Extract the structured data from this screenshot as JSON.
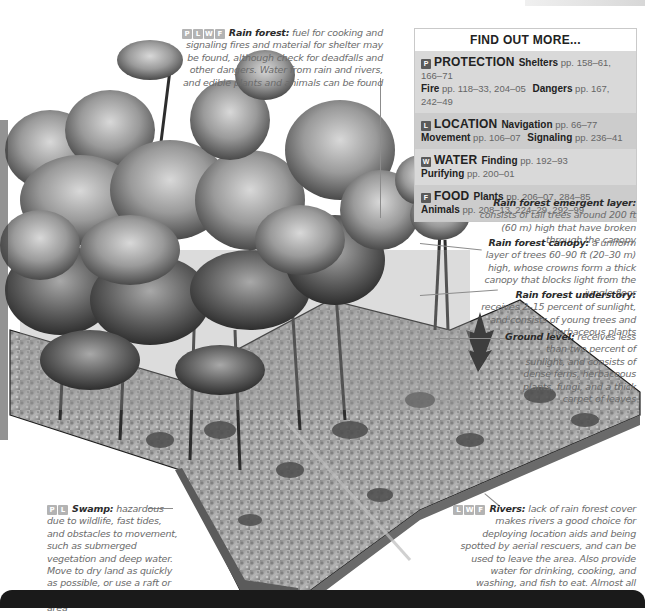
{
  "page": {
    "header_partial": "ROPICAL ENVIRONMENTS"
  },
  "find_out_more": {
    "title": "FIND OUT MORE...",
    "sections": [
      {
        "badge": "P",
        "category": "PROTECTION",
        "lines": [
          [
            {
              "topic": "Shelters",
              "pages": "pp. 158–61, 166–71"
            }
          ],
          [
            {
              "topic": "Fire",
              "pages": "pp. 118–33, 204–05"
            },
            {
              "topic": "Dangers",
              "pages": "pp. 167, 242–49"
            }
          ]
        ]
      },
      {
        "badge": "L",
        "category": "LOCATION",
        "lines": [
          [
            {
              "topic": "Navigation",
              "pages": "pp. 66–77"
            }
          ],
          [
            {
              "topic": "Movement",
              "pages": "pp. 106–07"
            },
            {
              "topic": "Signaling",
              "pages": "pp. 236–41"
            }
          ]
        ]
      },
      {
        "badge": "W",
        "category": "WATER",
        "lines": [
          [
            {
              "topic": "Finding",
              "pages": "pp. 192–93"
            }
          ],
          [
            {
              "topic": "Purifying",
              "pages": "pp. 200–01"
            }
          ]
        ]
      },
      {
        "badge": "F",
        "category": "FOOD",
        "lines": [
          [
            {
              "topic": "Plants",
              "pages": "pp. 206–07, 284–85"
            }
          ],
          [
            {
              "topic": "Animals",
              "pages": "pp. 208–13, 224–29, 292–99"
            }
          ]
        ]
      }
    ]
  },
  "annotations": {
    "rain_forest": {
      "badges": [
        "P",
        "L",
        "W",
        "F"
      ],
      "title": "Rain forest:",
      "text": " fuel for cooking and signaling fires and material for shelter may be found, although check for deadfalls and other dangers. Water from rain and rivers, and edible plants and animals can be found"
    },
    "emergent": {
      "title": "Rain forest emergent layer:",
      "text": " consists of tall trees around 200 ft (60 m) high that have broken through the canopy"
    },
    "canopy": {
      "title": "Rain forest canopy:",
      "text": " a uniform layer of trees 60–90 ft (20–30 m) high, whose crowns form a thick canopy that blocks light from the jungle floor"
    },
    "understory": {
      "title": "Rain forest understory:",
      "text": " receives 2–15 percent of sunlight, and consists of young trees and herbaceous plants"
    },
    "ground": {
      "title": "Ground level:",
      "text": " receives less than two percent of sunlight, and consists of dense ferns, herbaceous plants, fungi, and a thick carpet of leaves"
    },
    "swamp": {
      "badges": [
        "P",
        "L"
      ],
      "title": "Swamp:",
      "text": " hazardous due to wildlife, fast tides, and obstacles to movement, such as submerged vegetation and deep water. Move to dry land as quickly as possible, or use a raft or flotation aid to leave the area"
    },
    "rivers": {
      "badges": [
        "L",
        "W",
        "F"
      ],
      "title": "Rivers:",
      "text": " lack of rain forest cover makes rivers a good choice for deploying location aids and being spotted by aerial rescuers, and can be used to leave the area. Also provide water for drinking, cooking, and washing, and fish to eat. Almost all rivers will lead you to civilization"
    }
  },
  "colors": {
    "box_bg_light": "#d9d9d9",
    "box_bg_dark": "#cccccc",
    "badge": "#5a5a5a",
    "title_text": "#2b2b2b",
    "body_text": "#6b6b6b",
    "bottom_bar": "#1a1a1a"
  }
}
